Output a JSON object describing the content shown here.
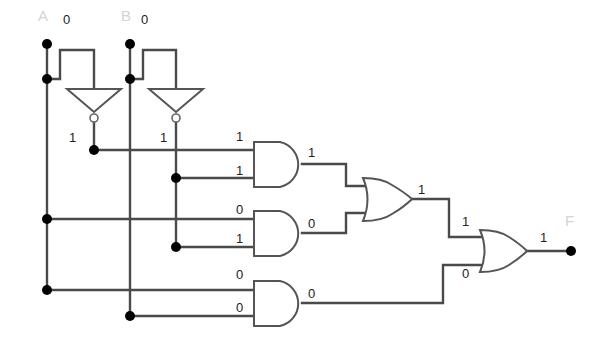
{
  "diagram": {
    "type": "logic-circuit",
    "colors": {
      "wire": "#4a4a4a",
      "node": "#000000",
      "label": "#222222",
      "name_label": "#d4d4d4"
    },
    "inputs": {
      "a": {
        "name": "A",
        "value": "0"
      },
      "b": {
        "name": "B",
        "value": "0"
      }
    },
    "output": {
      "name": "F",
      "value": "1"
    },
    "not_gates": [
      {
        "id": "not_a",
        "output_value": "1"
      },
      {
        "id": "not_b",
        "output_value": "1"
      }
    ],
    "and_gates": [
      {
        "id": "and1",
        "in1": "1",
        "in2": "1",
        "out": "1"
      },
      {
        "id": "and2",
        "in1": "0",
        "in2": "1",
        "out": "0"
      },
      {
        "id": "and3",
        "in1": "0",
        "in2": "0",
        "out": "0"
      }
    ],
    "or_gates": [
      {
        "id": "or1",
        "out": "1"
      },
      {
        "id": "or2",
        "in1": "1",
        "in2": "0",
        "out": "1"
      }
    ]
  }
}
